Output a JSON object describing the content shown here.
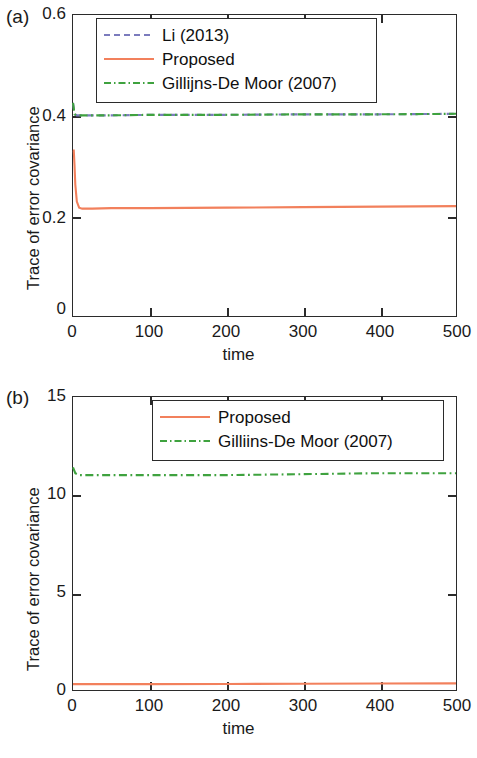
{
  "figure": {
    "panels": [
      {
        "tag": "(a)",
        "xlabel": "time",
        "ylabel": "Trace of error covariance",
        "yticks": [
          "0",
          "0.2",
          "0.4",
          "0.6"
        ],
        "xticks": [
          "0",
          "100",
          "200",
          "300",
          "400",
          "500"
        ],
        "legend": [
          {
            "label": "Li (2013)",
            "style": "dashed",
            "color": "#7b7bbd"
          },
          {
            "label": "Proposed",
            "style": "solid",
            "color": "#f2805c"
          },
          {
            "label": "Gillijns-De Moor (2007)",
            "style": "dashdot",
            "color": "#3fa23f"
          }
        ]
      },
      {
        "tag": "(b)",
        "xlabel": "time",
        "ylabel": "Trace of error covariance",
        "yticks": [
          "0",
          "5",
          "10",
          "15"
        ],
        "xticks": [
          "0",
          "100",
          "200",
          "300",
          "400",
          "500"
        ],
        "legend": [
          {
            "label": "Proposed",
            "style": "solid",
            "color": "#f2805c"
          },
          {
            "label": "Gilliins-De Moor (2007)",
            "style": "dashdot",
            "color": "#3fa23f"
          }
        ]
      }
    ]
  },
  "chart_data": [
    {
      "type": "line",
      "panel": "(a)",
      "title": "",
      "xlabel": "time",
      "ylabel": "Trace of error covariance",
      "xlim": [
        0,
        500
      ],
      "ylim": [
        0,
        0.6
      ],
      "xticks": [
        0,
        100,
        200,
        300,
        400,
        500
      ],
      "yticks": [
        0,
        0.2,
        0.4,
        0.6
      ],
      "grid": false,
      "legend_position": "top-center",
      "series": [
        {
          "name": "Li (2013)",
          "color": "#7b7bbd",
          "linestyle": "dashed",
          "x": [
            0,
            2,
            5,
            10,
            25,
            50,
            100,
            200,
            300,
            400,
            500
          ],
          "values": [
            0.425,
            0.402,
            0.4,
            0.4,
            0.4,
            0.4,
            0.401,
            0.401,
            0.402,
            0.402,
            0.403
          ]
        },
        {
          "name": "Proposed",
          "color": "#f2805c",
          "linestyle": "solid",
          "x": [
            0,
            1,
            2,
            3,
            5,
            8,
            12,
            25,
            50,
            100,
            200,
            300,
            400,
            500
          ],
          "values": [
            0.33,
            0.33,
            0.3,
            0.262,
            0.228,
            0.216,
            0.214,
            0.214,
            0.215,
            0.215,
            0.216,
            0.217,
            0.218,
            0.219
          ]
        },
        {
          "name": "Gillijns-De Moor (2007)",
          "color": "#3fa23f",
          "linestyle": "dashdot",
          "x": [
            0,
            2,
            5,
            10,
            25,
            50,
            100,
            200,
            300,
            400,
            500
          ],
          "values": [
            0.425,
            0.402,
            0.4,
            0.4,
            0.4,
            0.4,
            0.401,
            0.401,
            0.402,
            0.402,
            0.403
          ]
        }
      ]
    },
    {
      "type": "line",
      "panel": "(b)",
      "title": "",
      "xlabel": "time",
      "ylabel": "Trace of error covariance",
      "xlim": [
        0,
        500
      ],
      "ylim": [
        0,
        15
      ],
      "xticks": [
        0,
        100,
        200,
        300,
        400,
        500
      ],
      "yticks": [
        0,
        5,
        10,
        15
      ],
      "grid": false,
      "legend_position": "top-center",
      "series": [
        {
          "name": "Proposed",
          "color": "#f2805c",
          "linestyle": "solid",
          "x": [
            0,
            5,
            25,
            50,
            100,
            200,
            300,
            400,
            500
          ],
          "values": [
            0.3,
            0.3,
            0.3,
            0.3,
            0.3,
            0.31,
            0.32,
            0.33,
            0.34
          ]
        },
        {
          "name": "Gilliins-De Moor (2007)",
          "color": "#3fa23f",
          "linestyle": "dashdot",
          "x": [
            0,
            3,
            8,
            25,
            50,
            100,
            200,
            300,
            400,
            500
          ],
          "values": [
            11.4,
            11.1,
            11.0,
            11.0,
            11.0,
            11.0,
            11.0,
            11.05,
            11.1,
            11.1
          ]
        }
      ]
    }
  ]
}
